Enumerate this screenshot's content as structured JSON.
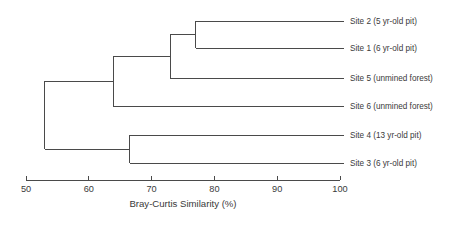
{
  "chart_data": {
    "type": "dendrogram",
    "title": "",
    "xlabel": "Bray-Curtis Similarity (%)",
    "ylabel": "",
    "xlim": [
      50,
      100
    ],
    "x_ticks": [
      50,
      60,
      70,
      80,
      90,
      100
    ],
    "x_tick_labels": [
      "50",
      "60",
      "70",
      "80",
      "90",
      "100"
    ],
    "grid": false,
    "legend": false,
    "orientation": "horizontal-right-leaves",
    "line_color": "#4a4a4a",
    "leaves": [
      {
        "id": "site2",
        "label": "Site 2 (5 yr-old pit)"
      },
      {
        "id": "site1",
        "label": "Site 1 (6 yr-old pit)"
      },
      {
        "id": "site5",
        "label": "Site 5 (unmined forest)"
      },
      {
        "id": "site6",
        "label": "Site 6 (unmined forest)"
      },
      {
        "id": "site4",
        "label": "Site 4 (13 yr-old pit)"
      },
      {
        "id": "site3",
        "label": "Site 3 (6 yr-old pit)"
      }
    ],
    "merges": [
      {
        "id": "n1",
        "children": [
          "site2",
          "site1"
        ],
        "similarity": 77.0
      },
      {
        "id": "n2",
        "children": [
          "n1",
          "site5"
        ],
        "similarity": 73.0
      },
      {
        "id": "n3",
        "children": [
          "n2",
          "site6"
        ],
        "similarity": 63.9
      },
      {
        "id": "n4",
        "children": [
          "site4",
          "site3"
        ],
        "similarity": 66.5
      },
      {
        "id": "n5",
        "children": [
          "n3",
          "n4"
        ],
        "similarity": 53.0
      }
    ]
  }
}
